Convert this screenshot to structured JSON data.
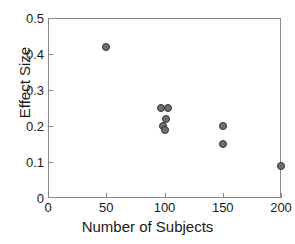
{
  "chart_data": {
    "type": "scatter",
    "title": "",
    "xlabel": "Number of Subjects",
    "ylabel": "Effect Size",
    "xlim": [
      0,
      200
    ],
    "ylim": [
      0,
      0.5
    ],
    "xticks": [
      0,
      50,
      100,
      150,
      200
    ],
    "xtick_labels": [
      "0",
      "50",
      "100",
      "150",
      "200"
    ],
    "yticks": [
      0,
      0.1,
      0.2,
      0.3,
      0.4,
      0.5
    ],
    "ytick_labels": [
      "0",
      "0.1",
      "0.2",
      "0.3",
      "0.4",
      "0.5"
    ],
    "grid": false,
    "legend": null,
    "marker_face_color": "#6f6f6f",
    "marker_edge_color": "#333333",
    "axis_color": "#8a8a8a",
    "points": [
      {
        "x": 50,
        "y": 0.42
      },
      {
        "x": 97,
        "y": 0.25
      },
      {
        "x": 103,
        "y": 0.25
      },
      {
        "x": 101,
        "y": 0.22
      },
      {
        "x": 99,
        "y": 0.2
      },
      {
        "x": 100,
        "y": 0.19
      },
      {
        "x": 150,
        "y": 0.2
      },
      {
        "x": 150,
        "y": 0.15
      },
      {
        "x": 200,
        "y": 0.09
      }
    ]
  }
}
